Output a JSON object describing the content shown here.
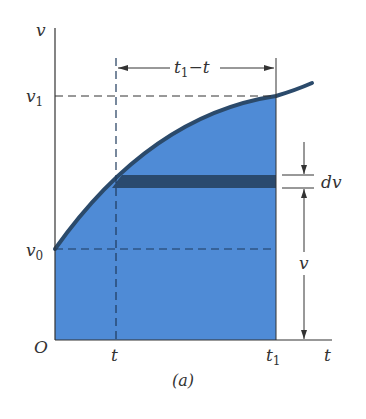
{
  "figure": {
    "caption": "(a)",
    "axes": {
      "y_label": "v",
      "x_label": "t",
      "origin_label": "O"
    },
    "y_ticks": {
      "v1": "v",
      "v1_sub": "1",
      "v0": "v",
      "v0_sub": "0"
    },
    "x_ticks": {
      "t": "t",
      "t1": "t",
      "t1_sub": "1"
    },
    "interval_label": {
      "main": "t",
      "sub": "1",
      "rest": "−t"
    },
    "strip_label": "dv",
    "height_label": "v",
    "colors": {
      "fill": "#4f8bd6",
      "curve": "#2b4a6b",
      "strip": "#2a4a6e",
      "axis": "#333333"
    }
  }
}
